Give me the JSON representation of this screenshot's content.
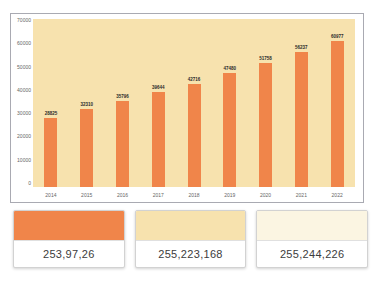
{
  "chart_data": {
    "type": "bar",
    "title": "",
    "categories": [
      "2014",
      "2015",
      "2016",
      "2017",
      "2018",
      "2019",
      "2020",
      "2021",
      "2022"
    ],
    "values": [
      28825,
      32310,
      35796,
      39644,
      42716,
      47480,
      51758,
      56237,
      60977
    ],
    "data_labels": [
      "28825",
      "32310",
      "35796",
      "39644",
      "42716",
      "47480",
      "51758",
      "56237",
      "60977"
    ],
    "xlabel": "",
    "ylabel": "",
    "ylim": [
      0,
      70000
    ],
    "y_ticks": [
      0,
      10000,
      20000,
      30000,
      40000,
      50000,
      60000,
      70000
    ],
    "grid": false,
    "legend": false,
    "bar_color": "#F0854A",
    "plot_background": "#F7E2AE"
  },
  "swatches": [
    {
      "label": "253,97,26",
      "color": "#F0854A"
    },
    {
      "label": "255,223,168",
      "color": "#F7E2AE"
    },
    {
      "label": "255,244,226",
      "color": "#FBF5E2"
    }
  ]
}
